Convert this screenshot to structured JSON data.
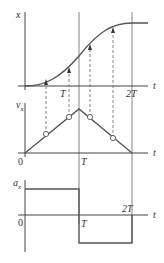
{
  "diagram": {
    "type": "kinematics graphs",
    "colors": {
      "axis": "#444444",
      "curve": "#555555",
      "guide": "#666666"
    },
    "panels": [
      {
        "name": "position",
        "ylabel": "x",
        "xlabel": "t",
        "ticks": [
          "T",
          "2T"
        ]
      },
      {
        "name": "velocity",
        "ylabel": "v",
        "ysub": "x",
        "xlabel": "t",
        "origin": "0",
        "ticks": [
          "T"
        ]
      },
      {
        "name": "acceleration",
        "ylabel": "a",
        "ysub": "x",
        "xlabel": "t",
        "origin": "0",
        "ticks": [
          "T",
          "2T"
        ]
      }
    ]
  }
}
